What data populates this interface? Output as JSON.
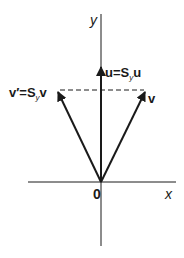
{
  "diagram": {
    "type": "vector-reflection",
    "axes": {
      "x_label": "x",
      "y_label": "y",
      "origin_label": "0"
    },
    "vectors": [
      {
        "name": "v",
        "label": "v",
        "from": [
          0,
          0
        ],
        "to": [
          1,
          2
        ]
      },
      {
        "name": "v_prime",
        "label_main": "v′=S",
        "label_sub": "y",
        "label_end": "v",
        "from": [
          0,
          0
        ],
        "to": [
          -1,
          2
        ]
      },
      {
        "name": "u",
        "label_main": "u=S",
        "label_sub": "y",
        "label_end": "u",
        "from": [
          0,
          0
        ],
        "to": [
          0,
          2.5
        ]
      }
    ],
    "dashed_connector": "horizontal dashed line joining tips of v and v′",
    "colors": {
      "ink": "#1a1a1a",
      "background": "#ffffff"
    }
  }
}
